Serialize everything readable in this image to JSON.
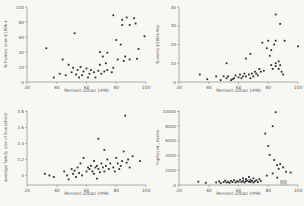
{
  "figure": {
    "background": "#f7f7f4",
    "point_color": "#2f2f2f",
    "axis_color": "#8a8a8a",
    "label_color": "#5a5a5a"
  },
  "chart_data": [
    {
      "id": "top-left",
      "type": "scatter",
      "title": "",
      "xlabel": "Percent urban 1990",
      "ylabel": "% homes over $100k+",
      "xlim": [
        20,
        100
      ],
      "ylim": [
        0,
        100
      ],
      "xticks": [
        20,
        40,
        60,
        80,
        100
      ],
      "yticks": [
        0,
        20,
        40,
        60,
        80,
        100
      ],
      "grid": false,
      "legend": null,
      "points": [
        [
          33,
          45
        ],
        [
          38,
          6
        ],
        [
          42,
          11
        ],
        [
          44,
          30
        ],
        [
          46,
          9
        ],
        [
          48,
          23
        ],
        [
          50,
          13
        ],
        [
          51,
          19
        ],
        [
          52,
          65
        ],
        [
          53,
          10
        ],
        [
          54,
          16
        ],
        [
          55,
          6
        ],
        [
          56,
          20
        ],
        [
          57,
          9
        ],
        [
          58,
          14
        ],
        [
          60,
          18
        ],
        [
          61,
          6
        ],
        [
          62,
          11
        ],
        [
          63,
          16
        ],
        [
          65,
          13
        ],
        [
          66,
          6
        ],
        [
          68,
          15
        ],
        [
          69,
          40
        ],
        [
          69,
          23
        ],
        [
          70,
          11
        ],
        [
          71,
          34
        ],
        [
          72,
          14
        ],
        [
          73,
          25
        ],
        [
          74,
          39
        ],
        [
          74,
          16
        ],
        [
          77,
          13
        ],
        [
          78,
          89
        ],
        [
          78,
          19
        ],
        [
          80,
          56
        ],
        [
          81,
          30
        ],
        [
          83,
          50
        ],
        [
          84,
          83
        ],
        [
          84,
          76
        ],
        [
          85,
          28
        ],
        [
          86,
          34
        ],
        [
          87,
          86
        ],
        [
          89,
          76
        ],
        [
          89,
          30
        ],
        [
          92,
          85
        ],
        [
          93,
          78
        ],
        [
          94,
          31
        ],
        [
          95,
          44
        ],
        [
          99,
          61
        ]
      ]
    },
    {
      "id": "top-right",
      "type": "scatter",
      "title": "",
      "xlabel": "Percent urban 1990",
      "ylabel": "% rents $500+/mo",
      "xlim": [
        20,
        100
      ],
      "ylim": [
        0,
        40
      ],
      "xticks": [
        20,
        40,
        60,
        80,
        100
      ],
      "yticks": [
        0,
        10,
        20,
        30,
        40
      ],
      "grid": false,
      "legend": null,
      "points": [
        [
          34,
          4
        ],
        [
          39,
          1.5
        ],
        [
          45,
          3
        ],
        [
          48,
          1
        ],
        [
          50,
          3
        ],
        [
          52,
          10
        ],
        [
          52,
          2
        ],
        [
          53,
          3
        ],
        [
          55,
          1
        ],
        [
          56,
          1.5
        ],
        [
          57,
          2
        ],
        [
          58,
          3.5
        ],
        [
          60,
          2.5
        ],
        [
          61,
          4
        ],
        [
          62,
          2
        ],
        [
          63,
          3
        ],
        [
          64,
          4.5
        ],
        [
          65,
          12.5
        ],
        [
          65,
          3
        ],
        [
          67,
          4
        ],
        [
          68,
          15
        ],
        [
          68,
          2
        ],
        [
          69,
          4.5
        ],
        [
          70,
          3
        ],
        [
          71,
          5.5
        ],
        [
          72,
          4.5
        ],
        [
          73,
          3.5
        ],
        [
          74,
          7
        ],
        [
          75,
          5.5
        ],
        [
          76,
          21
        ],
        [
          77,
          6
        ],
        [
          79,
          18
        ],
        [
          80,
          22
        ],
        [
          81,
          14
        ],
        [
          82,
          17
        ],
        [
          82,
          9
        ],
        [
          83,
          7
        ],
        [
          84,
          20
        ],
        [
          85,
          36
        ],
        [
          85,
          22
        ],
        [
          85,
          10
        ],
        [
          85,
          8.5
        ],
        [
          87,
          11
        ],
        [
          87,
          7
        ],
        [
          88,
          31
        ],
        [
          88,
          9
        ],
        [
          89,
          5.5
        ],
        [
          90,
          4
        ],
        [
          91,
          22
        ],
        [
          100,
          19
        ]
      ]
    },
    {
      "id": "bottom-left",
      "type": "scatter",
      "title": "",
      "xlabel": "Percent urban 1990",
      "ylabel": "average family size of household",
      "xlim": [
        20,
        100
      ],
      "ylim": [
        2.88,
        3.82
      ],
      "xticks": [
        20,
        40,
        60,
        80,
        100
      ],
      "yticks": [
        3,
        3.2,
        3.4,
        3.6,
        3.8
      ],
      "grid": false,
      "legend": null,
      "points": [
        [
          32,
          3.02
        ],
        [
          35,
          3.0
        ],
        [
          38,
          2.98
        ],
        [
          45,
          3.05
        ],
        [
          47,
          3.0
        ],
        [
          48,
          2.95
        ],
        [
          50,
          3.08
        ],
        [
          51,
          3.02
        ],
        [
          52,
          3.06
        ],
        [
          53,
          2.98
        ],
        [
          54,
          3.1
        ],
        [
          55,
          3.03
        ],
        [
          56,
          3.15
        ],
        [
          57,
          3.0
        ],
        [
          58,
          3.22
        ],
        [
          60,
          3.05
        ],
        [
          61,
          3.1
        ],
        [
          62,
          3.08
        ],
        [
          63,
          3.12
        ],
        [
          64,
          3.05
        ],
        [
          65,
          3.02
        ],
        [
          65,
          3.18
        ],
        [
          66,
          3.1
        ],
        [
          67,
          2.96
        ],
        [
          67,
          3.12
        ],
        [
          68,
          3.46
        ],
        [
          68,
          3.08
        ],
        [
          69,
          3.04
        ],
        [
          70,
          3.15
        ],
        [
          71,
          3.1
        ],
        [
          72,
          3.32
        ],
        [
          72,
          3.05
        ],
        [
          73,
          3.12
        ],
        [
          74,
          3.2
        ],
        [
          75,
          3.08
        ],
        [
          76,
          3.15
        ],
        [
          78,
          3.1
        ],
        [
          79,
          3.05
        ],
        [
          80,
          3.22
        ],
        [
          81,
          3.15
        ],
        [
          82,
          3.08
        ],
        [
          83,
          3.12
        ],
        [
          84,
          3.18
        ],
        [
          85,
          3.3
        ],
        [
          86,
          3.75
        ],
        [
          87,
          3.16
        ],
        [
          88,
          3.2
        ],
        [
          89,
          3.1
        ],
        [
          91,
          3.24
        ],
        [
          96,
          3.18
        ]
      ]
    },
    {
      "id": "bottom-right",
      "type": "scatter",
      "title": "",
      "xlabel": "Percent urban 1990",
      "ylabel": "Pop/sq mi, metro",
      "xlim": [
        20,
        100
      ],
      "ylim": [
        0,
        10200
      ],
      "xticks": [
        20,
        40,
        60,
        80,
        100
      ],
      "yticks": [
        0,
        2000,
        4000,
        6000,
        8000,
        10000
      ],
      "grid": false,
      "legend": null,
      "points": [
        [
          33,
          450
        ],
        [
          38,
          300
        ],
        [
          45,
          350
        ],
        [
          47,
          500
        ],
        [
          48,
          250
        ],
        [
          50,
          400
        ],
        [
          51,
          600
        ],
        [
          52,
          350
        ],
        [
          53,
          450
        ],
        [
          54,
          300
        ],
        [
          55,
          550
        ],
        [
          56,
          400
        ],
        [
          57,
          650
        ],
        [
          58,
          350
        ],
        [
          59,
          500
        ],
        [
          60,
          450
        ],
        [
          61,
          700
        ],
        [
          62,
          400
        ],
        [
          63,
          550
        ],
        [
          63,
          900
        ],
        [
          64,
          350
        ],
        [
          65,
          500
        ],
        [
          65,
          800
        ],
        [
          66,
          600
        ],
        [
          67,
          450
        ],
        [
          67,
          1100
        ],
        [
          68,
          700
        ],
        [
          68,
          400
        ],
        [
          69,
          550
        ],
        [
          70,
          350
        ],
        [
          70,
          900
        ],
        [
          71,
          500
        ],
        [
          72,
          650
        ],
        [
          73,
          400
        ],
        [
          74,
          800
        ],
        [
          75,
          550
        ],
        [
          78,
          7000
        ],
        [
          79,
          1280
        ],
        [
          80,
          5300
        ],
        [
          81,
          4100
        ],
        [
          83,
          8000
        ],
        [
          83,
          1570
        ],
        [
          84,
          3400
        ],
        [
          85,
          9900
        ],
        [
          86,
          2700
        ],
        [
          86,
          1000
        ],
        [
          87,
          2200
        ],
        [
          88,
          2850
        ],
        [
          90,
          2400
        ],
        [
          92,
          1800
        ],
        [
          95,
          1700
        ]
      ]
    }
  ]
}
